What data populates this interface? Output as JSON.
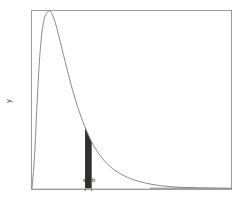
{
  "figure": {
    "background_color": "#ffffff",
    "frame_color": "#9a9a9a",
    "curve_color": "#8a8a8a",
    "shade_color": "#2f2f2f",
    "axis_label_y": "y",
    "tick_labels": {
      "a": "a",
      "b": "b"
    }
  },
  "chart_data": {
    "type": "line",
    "title": "",
    "subtitle": "",
    "xlabel": "",
    "ylabel": "y",
    "grid": false,
    "legend": null,
    "xlim": [
      0,
      12
    ],
    "ylim": [
      0,
      1
    ],
    "x_ticks": [
      3.2,
      3.6
    ],
    "x_tick_labels": [
      "a",
      "b"
    ],
    "y_ticks": [],
    "y_tick_labels": [],
    "series": [
      {
        "name": "probability density",
        "description": "right-skewed unimodal density curve rising steeply from the origin to a peak near x=1.1 then decaying with a long right tail toward zero",
        "x": [
          0.0,
          0.15,
          0.3,
          0.45,
          0.6,
          0.75,
          0.9,
          1.05,
          1.2,
          1.4,
          1.6,
          1.8,
          2.0,
          2.3,
          2.6,
          2.9,
          3.2,
          3.6,
          4.0,
          4.5,
          5.0,
          5.6,
          6.2,
          7.0,
          8.0,
          9.0,
          10.0,
          11.0,
          12.0
        ],
        "y": [
          0.0,
          0.18,
          0.47,
          0.72,
          0.88,
          0.96,
          0.99,
          1.0,
          0.985,
          0.935,
          0.865,
          0.79,
          0.715,
          0.605,
          0.505,
          0.42,
          0.345,
          0.262,
          0.2,
          0.143,
          0.103,
          0.07,
          0.048,
          0.028,
          0.014,
          0.007,
          0.004,
          0.002,
          0.001
        ]
      }
    ],
    "annotations": [
      {
        "type": "shaded_area",
        "label": "area between a and b",
        "x_start": 3.2,
        "x_end": 3.6,
        "y_start": 0.345,
        "y_end": 0.262,
        "color": "#2f2f2f"
      },
      {
        "type": "tick_text",
        "label": "a",
        "x": 3.2,
        "y": 0
      },
      {
        "type": "tick_text",
        "label": "b",
        "x": 3.6,
        "y": 0
      }
    ]
  }
}
